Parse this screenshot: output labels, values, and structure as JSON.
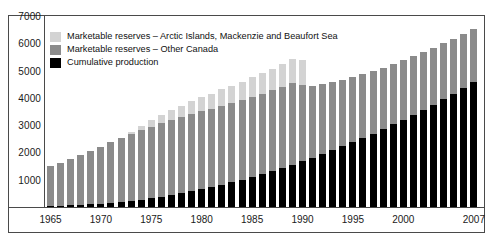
{
  "chart_data": {
    "type": "bar",
    "stacked": true,
    "title": "",
    "subtitle": "",
    "xlabel": "",
    "ylabel": "",
    "ylim": [
      0,
      7000
    ],
    "yticks": [
      1000,
      2000,
      3000,
      4000,
      5000,
      6000,
      7000
    ],
    "ytick_labels": [
      "1000",
      "2000",
      "3000",
      "4000",
      "5000",
      "6000",
      "7000"
    ],
    "grid": false,
    "legend_position": "upper-left",
    "x": [
      1965,
      1966,
      1967,
      1968,
      1969,
      1970,
      1971,
      1972,
      1973,
      1974,
      1975,
      1976,
      1977,
      1978,
      1979,
      1980,
      1981,
      1982,
      1983,
      1984,
      1985,
      1986,
      1987,
      1988,
      1989,
      1990,
      1991,
      1992,
      1993,
      1994,
      1995,
      1996,
      1997,
      1998,
      1999,
      2000,
      2001,
      2002,
      2003,
      2004,
      2005,
      2006,
      2007
    ],
    "xtick_labels": [
      "1965",
      "1970",
      "1975",
      "1980",
      "1985",
      "1990",
      "1995",
      "2000",
      "2007"
    ],
    "xticks": [
      1965,
      1970,
      1975,
      1980,
      1985,
      1990,
      1995,
      2000,
      2007
    ],
    "series": [
      {
        "name": "Cumulative production",
        "color": "#000000",
        "values": [
          30,
          45,
          60,
          80,
          100,
          125,
          155,
          190,
          230,
          275,
          325,
          380,
          440,
          505,
          575,
          650,
          730,
          815,
          905,
          1000,
          1100,
          1205,
          1315,
          1430,
          1550,
          1675,
          1805,
          1940,
          2080,
          2225,
          2375,
          2530,
          2690,
          2855,
          3025,
          3200,
          3380,
          3565,
          3755,
          3950,
          4150,
          4355,
          4565
        ]
      },
      {
        "name": "Marketable reserves – Other Canada",
        "color": "#8b8b8b",
        "values": [
          1470,
          1555,
          1690,
          1820,
          1955,
          2075,
          2220,
          2330,
          2430,
          2555,
          2625,
          2700,
          2745,
          2785,
          2830,
          2855,
          2870,
          2895,
          2905,
          2920,
          2940,
          2955,
          2960,
          2975,
          2985,
          2800,
          2625,
          2560,
          2490,
          2430,
          2375,
          2330,
          2290,
          2250,
          2210,
          2175,
          2140,
          2105,
          2075,
          2045,
          2015,
          1985,
          1955
        ]
      },
      {
        "name": "Marketable reserves – Arctic Islands, Mackenzie and Beaufort Sea",
        "color": "#d3d3d3",
        "values": [
          0,
          0,
          0,
          0,
          0,
          0,
          0,
          0,
          80,
          150,
          230,
          310,
          380,
          430,
          480,
          520,
          560,
          600,
          640,
          680,
          720,
          760,
          800,
          840,
          880,
          900,
          0,
          0,
          0,
          0,
          0,
          0,
          0,
          0,
          0,
          0,
          0,
          0,
          0,
          0,
          0,
          0,
          0
        ]
      }
    ],
    "totals": [
      1500,
      1600,
      1750,
      1900,
      2055,
      2200,
      2375,
      2520,
      2740,
      2980,
      3180,
      3390,
      3565,
      3720,
      3885,
      4025,
      4160,
      4310,
      4450,
      4600,
      4760,
      4920,
      5075,
      5245,
      5415,
      5375,
      4430,
      4500,
      4570,
      4655,
      4750,
      4860,
      4980,
      5105,
      5235,
      5375,
      5520,
      5670,
      5830,
      5995,
      6165,
      6340,
      6520
    ]
  },
  "legend": {
    "items": [
      {
        "label": "Marketable reserves – Arctic Islands, Mackenzie and Beaufort Sea",
        "color": "#d3d3d3",
        "swatch": "arctic-swatch"
      },
      {
        "label": "Marketable reserves – Other Canada",
        "color": "#8b8b8b",
        "swatch": "other-canada-swatch"
      },
      {
        "label": "Cumulative production",
        "color": "#000000",
        "swatch": "cumulative-production-swatch"
      }
    ]
  }
}
